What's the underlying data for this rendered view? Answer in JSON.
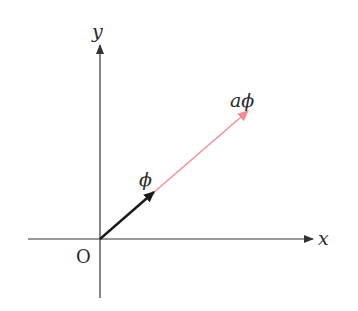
{
  "diagram": {
    "axes": {
      "x_label": "x",
      "y_label": "y",
      "origin_label": "O",
      "axis_color": "#333333"
    },
    "vectors": [
      {
        "name": "phi",
        "label": "ϕ",
        "color": "#1a1a1a"
      },
      {
        "name": "a-phi",
        "label": "aϕ",
        "color": "#f28b96"
      }
    ]
  }
}
